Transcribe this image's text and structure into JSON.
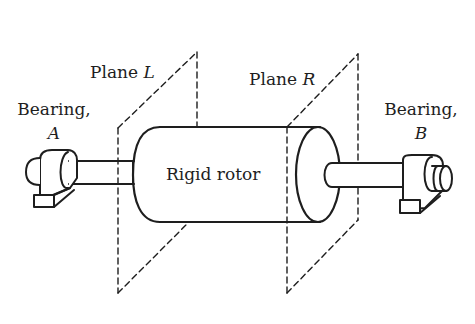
{
  "labels": {
    "plane_l_prefix": "Plane ",
    "plane_l_var": "L",
    "plane_r_prefix": "Plane ",
    "plane_r_var": "R",
    "bearing_a_title": "Bearing,",
    "bearing_a_var": "A",
    "bearing_b_title": "Bearing,",
    "bearing_b_var": "B",
    "rotor": "Rigid rotor"
  },
  "colors": {
    "line": "#1e1e1e",
    "background": "#ffffff"
  }
}
